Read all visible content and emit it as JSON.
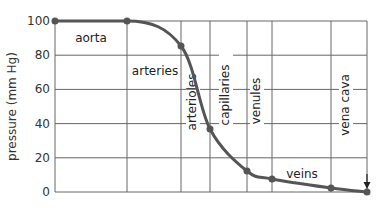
{
  "chart_data": {
    "type": "line",
    "title": "",
    "xlabel": "",
    "ylabel": "pressure (mm Hg)",
    "ylim": [
      0,
      100
    ],
    "yticks": [
      0,
      20,
      40,
      60,
      80,
      100
    ],
    "grid": true,
    "legend": null,
    "series": [
      {
        "name": "blood pressure",
        "color": "#555555",
        "points": [
          {
            "x": 0,
            "y": 100
          },
          {
            "x": 1,
            "y": 100
          },
          {
            "x": 2,
            "y": 85
          },
          {
            "x": 3,
            "y": 37
          },
          {
            "x": 4,
            "y": 12
          },
          {
            "x": 5,
            "y": 7.5
          },
          {
            "x": 6,
            "y": 2.5
          },
          {
            "x": 7,
            "y": 0.5
          }
        ]
      }
    ],
    "regions": [
      {
        "label": "aorta",
        "orientation": "horizontal"
      },
      {
        "label": "arteries",
        "orientation": "horizontal"
      },
      {
        "label": "arterioles",
        "orientation": "vertical"
      },
      {
        "label": "capillaries",
        "orientation": "vertical"
      },
      {
        "label": "venules",
        "orientation": "vertical"
      },
      {
        "label": "veins",
        "orientation": "horizontal"
      },
      {
        "label": "vena cava",
        "orientation": "vertical"
      }
    ],
    "annotations": [
      {
        "type": "arrow",
        "target": "vena cava endpoint",
        "direction": "down"
      }
    ]
  },
  "layout": {
    "plot": {
      "x0": 55,
      "y0": 21,
      "x1": 367,
      "y1": 192
    },
    "vlines": [
      55,
      127,
      181,
      210,
      247,
      272,
      331,
      367
    ],
    "point_px": [
      [
        55,
        21
      ],
      [
        127,
        21
      ],
      [
        181,
        46
      ],
      [
        210,
        129
      ],
      [
        247,
        171
      ],
      [
        272,
        179
      ],
      [
        331,
        188
      ],
      [
        367,
        192
      ]
    ],
    "label_pos": {
      "aorta": [
        91,
        42
      ],
      "arteries": [
        155,
        75
      ],
      "arterioles": [
        196,
        102
      ],
      "capillaries": [
        229,
        95
      ],
      "venules": [
        260,
        101
      ],
      "veins": [
        302,
        178
      ],
      "vena cava": [
        349,
        105
      ]
    }
  }
}
